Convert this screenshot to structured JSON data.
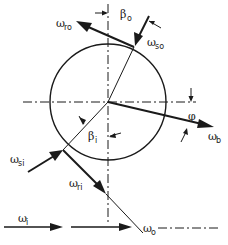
{
  "diagram": {
    "type": "velocity vector diagram (rotating circle with incoming/outgoing rays)",
    "colors": {
      "ink": "#1a1a1a",
      "background": "#ffffff"
    },
    "labels": {
      "omega_ro": {
        "symbol": "ω",
        "sub": "ro"
      },
      "beta_o": {
        "symbol": "β",
        "sub": "o"
      },
      "omega_so": {
        "symbol": "ω",
        "sub": "so"
      },
      "phi": {
        "symbol": "φ",
        "sub": ""
      },
      "omega_b": {
        "symbol": "ω",
        "sub": "b"
      },
      "beta_i": {
        "symbol": "β",
        "sub": "i"
      },
      "omega_si": {
        "symbol": "ω",
        "sub": "si"
      },
      "omega_ri": {
        "symbol": "ω",
        "sub": "ri"
      },
      "omega_i": {
        "symbol": "ω",
        "sub": "i"
      },
      "omega_o": {
        "symbol": "ω",
        "sub": "o"
      }
    }
  }
}
